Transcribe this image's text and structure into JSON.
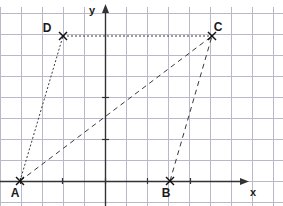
{
  "figure": {
    "title_fragment": "",
    "background_color": "#ffffff",
    "width": 283,
    "height": 206
  },
  "axes": {
    "x_label": "x",
    "y_label": "y",
    "axis_color": "#333333",
    "grid_color": "#b9b9c9",
    "grid_visible": true,
    "grid_spacing_px": 21,
    "origin_px": {
      "x": 105,
      "y": 181
    },
    "x_axis_y_px": 181,
    "y_axis_x_px": 105,
    "x_ticks_px": [
      20,
      62,
      105,
      147,
      190
    ],
    "x_arrow_tip_px": {
      "x": 243,
      "y": 181
    },
    "y_arrow_tip_px": {
      "x": 105,
      "y": 10
    },
    "x_label_pos_px": {
      "x": 253,
      "y": 196
    },
    "y_label_pos_px": {
      "x": 92,
      "y": 14
    }
  },
  "points": [
    {
      "name": "A",
      "x_px": 20,
      "y_px": 181,
      "label_dx": -5,
      "label_dy": 16,
      "marker": "x-cross"
    },
    {
      "name": "B",
      "x_px": 170,
      "y_px": 181,
      "label_dx": -4,
      "label_dy": 16,
      "marker": "x-cross"
    },
    {
      "name": "C",
      "x_px": 212,
      "y_px": 36,
      "label_dx": 6,
      "label_dy": -5,
      "marker": "x-cross"
    },
    {
      "name": "D",
      "x_px": 63,
      "y_px": 36,
      "label_dx": -16,
      "label_dy": -4,
      "marker": "x-cross"
    }
  ],
  "segments": [
    {
      "name": "segment-a-d",
      "from": "A",
      "to": "D",
      "style": "dotted",
      "color": "#3a3a3a",
      "dash": "2,2",
      "width": 1
    },
    {
      "name": "segment-d-c",
      "from": "D",
      "to": "C",
      "style": "dotted",
      "color": "#3a3a3a",
      "dash": "2,2",
      "width": 1
    },
    {
      "name": "segment-a-c",
      "from": "A",
      "to": "C",
      "style": "dashed",
      "color": "#3a3a3a",
      "dash": "5,4",
      "width": 1
    },
    {
      "name": "segment-b-c",
      "from": "B",
      "to": "C",
      "style": "dashed",
      "color": "#3a3a3a",
      "dash": "5,4",
      "width": 1
    }
  ],
  "chart_data": {
    "type": "scatter",
    "title": "",
    "xlabel": "x",
    "ylabel": "y",
    "grid": true,
    "legend": "none",
    "annotations": [
      "A",
      "B",
      "C",
      "D"
    ],
    "categories": [
      "A",
      "B",
      "C",
      "D"
    ],
    "x": [
      -4,
      3,
      5,
      -2
    ],
    "y": [
      0,
      0,
      7,
      7
    ],
    "xlim": [
      -5,
      6.5
    ],
    "ylim": [
      -1,
      8
    ],
    "points": [
      {
        "label": "A",
        "x": -4,
        "y": 0
      },
      {
        "label": "B",
        "x": 3,
        "y": 0
      },
      {
        "label": "C",
        "x": 5,
        "y": 7
      },
      {
        "label": "D",
        "x": -2,
        "y": 7
      }
    ],
    "edges": [
      {
        "from": "A",
        "to": "D"
      },
      {
        "from": "D",
        "to": "C"
      },
      {
        "from": "A",
        "to": "C"
      },
      {
        "from": "B",
        "to": "C"
      }
    ]
  }
}
